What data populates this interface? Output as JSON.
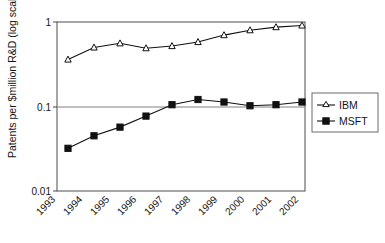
{
  "chart_data": {
    "type": "line",
    "title": "",
    "xlabel": "",
    "ylabel": "Patents per $million R&D (log scale)",
    "x": [
      "1993",
      "1994",
      "1995",
      "1996",
      "1997",
      "1998",
      "1999",
      "2000",
      "2001",
      "2002"
    ],
    "categories": [
      "1993",
      "1994",
      "1995",
      "1996",
      "1997",
      "1998",
      "1999",
      "2000",
      "2001",
      "2002"
    ],
    "yscale": "log",
    "ylim": [
      0.01,
      1
    ],
    "yticks": [
      "1",
      "0.1",
      "0.01"
    ],
    "ytick_values": [
      1,
      0.1,
      0.01
    ],
    "grid": "horizontal-at-0.1",
    "legend_position": "right",
    "series": [
      {
        "name": "IBM",
        "marker": "open-triangle",
        "color": "#111111",
        "values": [
          0.36,
          0.5,
          0.56,
          0.49,
          0.52,
          0.58,
          0.7,
          0.8,
          0.87,
          0.91
        ]
      },
      {
        "name": "MSFT",
        "marker": "filled-square",
        "color": "#111111",
        "values": [
          0.032,
          0.045,
          0.057,
          0.077,
          0.105,
          0.121,
          0.113,
          0.102,
          0.105,
          0.113
        ]
      }
    ]
  },
  "legend": {
    "items": [
      {
        "label": "IBM",
        "marker": "open-triangle"
      },
      {
        "label": "MSFT",
        "marker": "filled-square"
      }
    ]
  },
  "axes": {
    "y_title": "Patents per $million R&D (log scale)",
    "y_ticks": [
      "1",
      "0.1",
      "0.01"
    ],
    "x_ticks": [
      "1993",
      "1994",
      "1995",
      "1996",
      "1997",
      "1998",
      "1999",
      "2000",
      "2001",
      "2002"
    ]
  }
}
